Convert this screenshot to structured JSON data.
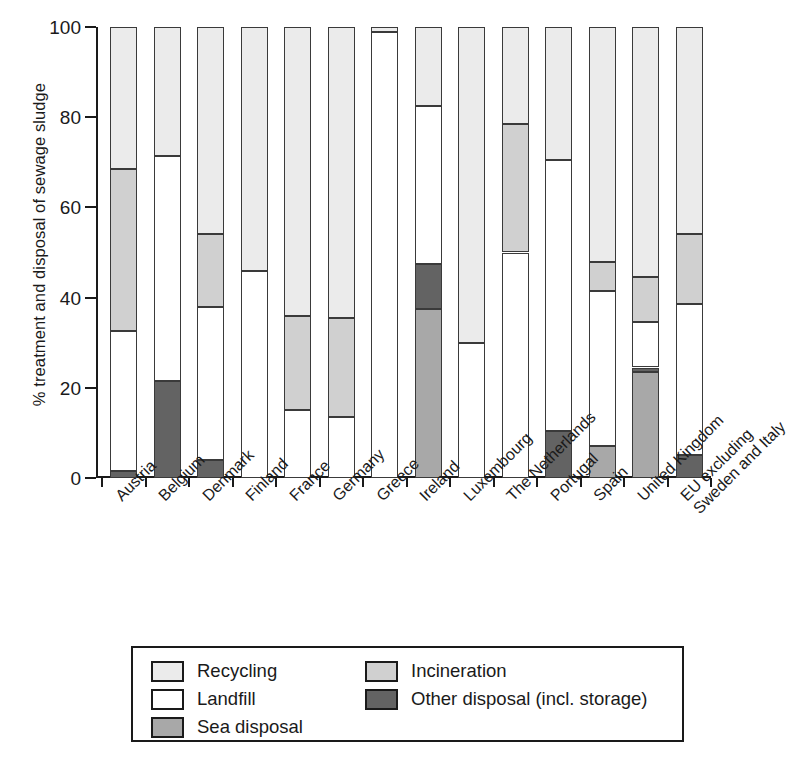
{
  "chart_data": {
    "type": "bar",
    "subtype": "stacked-bar-100-percent",
    "title": "",
    "xlabel": "",
    "ylabel": "% treatment and disposal of sewage sludge",
    "ylim": [
      0,
      100
    ],
    "yticks": [
      0,
      20,
      40,
      60,
      80,
      100
    ],
    "grid": false,
    "legend_position": "below-plot",
    "categories": [
      "Austria",
      "Belgium",
      "Denmark",
      "Finland",
      "France",
      "Germany",
      "Greece",
      "Ireland",
      "Luxembourg",
      "The Netherlands",
      "Portugal",
      "Spain",
      "United Kingdom",
      "EU excluding Sweden and Italy"
    ],
    "category_labels_multiline": [
      [
        "Austria"
      ],
      [
        "Belgium"
      ],
      [
        "Denmark"
      ],
      [
        "Finland"
      ],
      [
        "France"
      ],
      [
        "Germany"
      ],
      [
        "Greece"
      ],
      [
        "Ireland"
      ],
      [
        "Luxembourg"
      ],
      [
        "The Netherlands"
      ],
      [
        "Portugal"
      ],
      [
        "Spain"
      ],
      [
        "United Kingdom"
      ],
      [
        "EU excluding",
        "Sweden and Italy"
      ]
    ],
    "series": [
      {
        "name": "Other disposal (incl. storage)",
        "color": "#636363",
        "values": [
          1.5,
          21.5,
          4,
          0,
          0,
          0,
          0,
          10,
          0,
          0,
          10.5,
          0,
          1,
          5
        ]
      },
      {
        "name": "Sea disposal",
        "color": "#a8a8a8",
        "values": [
          0,
          0,
          0,
          0,
          0,
          0,
          0,
          37.5,
          0,
          0,
          0,
          7,
          23.5,
          0
        ]
      },
      {
        "name": "Landfill",
        "color": "#ffffff",
        "values": [
          31,
          50,
          34,
          46,
          15,
          13.5,
          99,
          35,
          30,
          50,
          60,
          34.5,
          10,
          33.5
        ]
      },
      {
        "name": "Incineration",
        "color": "#d0d0d0",
        "values": [
          36,
          0,
          16,
          0,
          21,
          22,
          0,
          0,
          0,
          28.5,
          0,
          6.5,
          10,
          15.5
        ]
      },
      {
        "name": "Recycling",
        "color": "#ebebeb",
        "values": [
          31.5,
          28.5,
          46,
          54,
          64,
          64.5,
          1,
          17.5,
          70,
          21.5,
          29.5,
          52,
          55.5,
          46
        ]
      }
    ],
    "stack_order_bottom_to_top_per_category": [
      [
        "Other disposal (incl. storage)",
        "Landfill",
        "Incineration",
        "Recycling"
      ],
      [
        "Other disposal (incl. storage)",
        "Landfill",
        "Recycling"
      ],
      [
        "Other disposal (incl. storage)",
        "Landfill",
        "Incineration",
        "Recycling"
      ],
      [
        "Landfill",
        "Recycling"
      ],
      [
        "Landfill",
        "Incineration",
        "Recycling"
      ],
      [
        "Landfill",
        "Incineration",
        "Recycling"
      ],
      [
        "Landfill",
        "Recycling"
      ],
      [
        "Sea disposal",
        "Other disposal (incl. storage)",
        "Landfill",
        "Recycling"
      ],
      [
        "Landfill",
        "Recycling"
      ],
      [
        "Landfill",
        "Incineration",
        "Recycling"
      ],
      [
        "Other disposal (incl. storage)",
        "Landfill",
        "Recycling"
      ],
      [
        "Sea disposal",
        "Landfill",
        "Incineration",
        "Recycling"
      ],
      [
        "Sea disposal",
        "Other disposal (incl. storage)",
        "Landfill",
        "Incineration",
        "Recycling"
      ],
      [
        "Other disposal (incl. storage)",
        "Landfill",
        "Incineration",
        "Recycling"
      ]
    ],
    "stacks": [
      {
        "category": "Austria",
        "segments": [
          {
            "name": "Other disposal (incl. storage)",
            "from": 0,
            "to": 1.5
          },
          {
            "name": "Landfill",
            "from": 1.5,
            "to": 32.5
          },
          {
            "name": "Incineration",
            "from": 32.5,
            "to": 68.5
          },
          {
            "name": "Recycling",
            "from": 68.5,
            "to": 100
          }
        ]
      },
      {
        "category": "Belgium",
        "segments": [
          {
            "name": "Other disposal (incl. storage)",
            "from": 0,
            "to": 21.5
          },
          {
            "name": "Landfill",
            "from": 21.5,
            "to": 71.5
          },
          {
            "name": "Recycling",
            "from": 71.5,
            "to": 100
          }
        ]
      },
      {
        "category": "Denmark",
        "segments": [
          {
            "name": "Other disposal (incl. storage)",
            "from": 0,
            "to": 4
          },
          {
            "name": "Landfill",
            "from": 4,
            "to": 38
          },
          {
            "name": "Incineration",
            "from": 38,
            "to": 54
          },
          {
            "name": "Recycling",
            "from": 54,
            "to": 100
          }
        ]
      },
      {
        "category": "Finland",
        "segments": [
          {
            "name": "Landfill",
            "from": 0,
            "to": 46
          },
          {
            "name": "Recycling",
            "from": 46,
            "to": 100
          }
        ]
      },
      {
        "category": "France",
        "segments": [
          {
            "name": "Landfill",
            "from": 0,
            "to": 15
          },
          {
            "name": "Incineration",
            "from": 15,
            "to": 36
          },
          {
            "name": "Recycling",
            "from": 36,
            "to": 100
          }
        ]
      },
      {
        "category": "Germany",
        "segments": [
          {
            "name": "Landfill",
            "from": 0,
            "to": 13.5
          },
          {
            "name": "Incineration",
            "from": 13.5,
            "to": 35.5
          },
          {
            "name": "Recycling",
            "from": 35.5,
            "to": 100
          }
        ]
      },
      {
        "category": "Greece",
        "segments": [
          {
            "name": "Landfill",
            "from": 0,
            "to": 99
          },
          {
            "name": "Recycling",
            "from": 99,
            "to": 100
          }
        ]
      },
      {
        "category": "Ireland",
        "segments": [
          {
            "name": "Sea disposal",
            "from": 0,
            "to": 37.5
          },
          {
            "name": "Other disposal (incl. storage)",
            "from": 37.5,
            "to": 47.5
          },
          {
            "name": "Landfill",
            "from": 47.5,
            "to": 82.5
          },
          {
            "name": "Recycling",
            "from": 82.5,
            "to": 100
          }
        ]
      },
      {
        "category": "Luxembourg",
        "segments": [
          {
            "name": "Landfill",
            "from": 0,
            "to": 30
          },
          {
            "name": "Recycling",
            "from": 30,
            "to": 100
          }
        ]
      },
      {
        "category": "The Netherlands",
        "segments": [
          {
            "name": "Landfill",
            "from": 0,
            "to": 50
          },
          {
            "name": "Incineration",
            "from": 50,
            "to": 78.5
          },
          {
            "name": "Recycling",
            "from": 78.5,
            "to": 100
          }
        ]
      },
      {
        "category": "Portugal",
        "segments": [
          {
            "name": "Other disposal (incl. storage)",
            "from": 0,
            "to": 10.5
          },
          {
            "name": "Landfill",
            "from": 10.5,
            "to": 70.5
          },
          {
            "name": "Recycling",
            "from": 70.5,
            "to": 100
          }
        ]
      },
      {
        "category": "Spain",
        "segments": [
          {
            "name": "Sea disposal",
            "from": 0,
            "to": 7
          },
          {
            "name": "Landfill",
            "from": 7,
            "to": 41.5
          },
          {
            "name": "Incineration",
            "from": 41.5,
            "to": 48
          },
          {
            "name": "Recycling",
            "from": 48,
            "to": 100
          }
        ]
      },
      {
        "category": "United Kingdom",
        "segments": [
          {
            "name": "Sea disposal",
            "from": 0,
            "to": 23.5
          },
          {
            "name": "Other disposal (incl. storage)",
            "from": 23.5,
            "to": 24.5
          },
          {
            "name": "Landfill",
            "from": 24.5,
            "to": 34.5
          },
          {
            "name": "Incineration",
            "from": 34.5,
            "to": 44.5
          },
          {
            "name": "Recycling",
            "from": 44.5,
            "to": 100
          }
        ]
      },
      {
        "category": "EU excluding Sweden and Italy",
        "segments": [
          {
            "name": "Other disposal (incl. storage)",
            "from": 0,
            "to": 5
          },
          {
            "name": "Landfill",
            "from": 5,
            "to": 38.5
          },
          {
            "name": "Incineration",
            "from": 38.5,
            "to": 54
          },
          {
            "name": "Recycling",
            "from": 54,
            "to": 100
          }
        ]
      }
    ],
    "legend": [
      {
        "label": "Recycling",
        "color": "#ebebeb"
      },
      {
        "label": "Landfill",
        "color": "#ffffff"
      },
      {
        "label": "Sea disposal",
        "color": "#a8a8a8"
      },
      {
        "label": "Incineration",
        "color": "#d0d0d0"
      },
      {
        "label": "Other disposal (incl. storage)",
        "color": "#636363"
      }
    ],
    "legend_columns": [
      [
        "Recycling",
        "Landfill",
        "Sea disposal"
      ],
      [
        "Incineration",
        "Other disposal (incl. storage)"
      ]
    ]
  }
}
